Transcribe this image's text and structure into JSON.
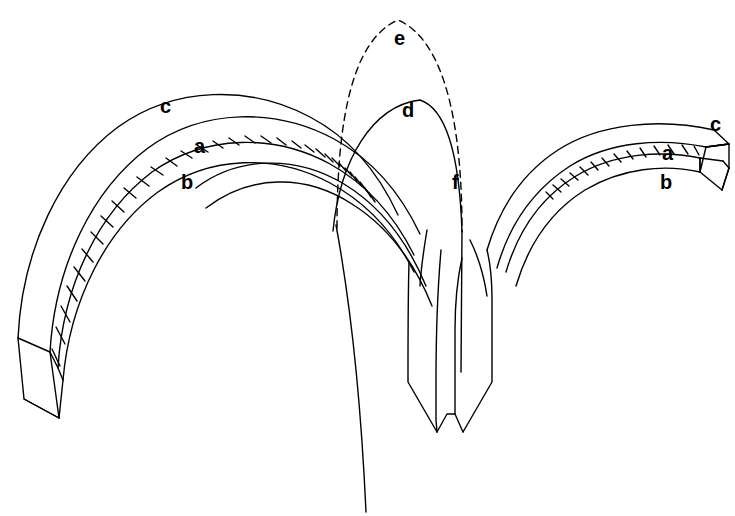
{
  "figure": {
    "background_color": "#ffffff",
    "stroke_color": "#000000",
    "width": 735,
    "height": 516
  },
  "labels": [
    {
      "id": "c-left",
      "text": "c",
      "x": 160,
      "y": 96,
      "refers_to": "extrados-line-left-arch"
    },
    {
      "id": "a-left",
      "text": "a",
      "x": 194,
      "y": 136,
      "refers_to": "voussoir-band-left-arch"
    },
    {
      "id": "b-left",
      "text": "b",
      "x": 181,
      "y": 172,
      "refers_to": "intrados-line-left-arch"
    },
    {
      "id": "e",
      "text": "e",
      "x": 394,
      "y": 28,
      "refers_to": "dashed-pointed-arch-profile"
    },
    {
      "id": "d",
      "text": "d",
      "x": 402,
      "y": 100,
      "refers_to": "solid-inner-arch-profile"
    },
    {
      "id": "f",
      "text": "f",
      "x": 452,
      "y": 172,
      "refers_to": "central-vertical-rib-line"
    },
    {
      "id": "c-right",
      "text": "c",
      "x": 710,
      "y": 114,
      "refers_to": "extrados-line-right-arch"
    },
    {
      "id": "a-right",
      "text": "a",
      "x": 662,
      "y": 143,
      "refers_to": "voussoir-band-right-arch"
    },
    {
      "id": "b-right",
      "text": "b",
      "x": 660,
      "y": 172,
      "refers_to": "intrados-line-right-arch"
    }
  ],
  "components": [
    {
      "name": "left-arch-rib",
      "description": "large arch band rising from lower-left springing block to the central pier, drawn in 3D with hatched voussoir joints"
    },
    {
      "name": "right-arch-rib",
      "description": "smaller arch band rising from the central pier to a 3D rectangular end block at right"
    },
    {
      "name": "central-pier",
      "description": "twin-legged pier with pointed lower ends at the centre of the drawing"
    },
    {
      "name": "dashed-arch-e",
      "description": "dashed tall pointed arch profile over the centre"
    },
    {
      "name": "solid-arch-d",
      "description": "solid inner arch profile below the dashed one"
    },
    {
      "name": "long-diagonal",
      "description": "long line descending from the centre to the bottom edge"
    },
    {
      "name": "left-end-block",
      "description": "parallelogram springing block at the foot of the left arch"
    },
    {
      "name": "right-end-block",
      "description": "3D rectangular block terminating the right arch"
    }
  ]
}
